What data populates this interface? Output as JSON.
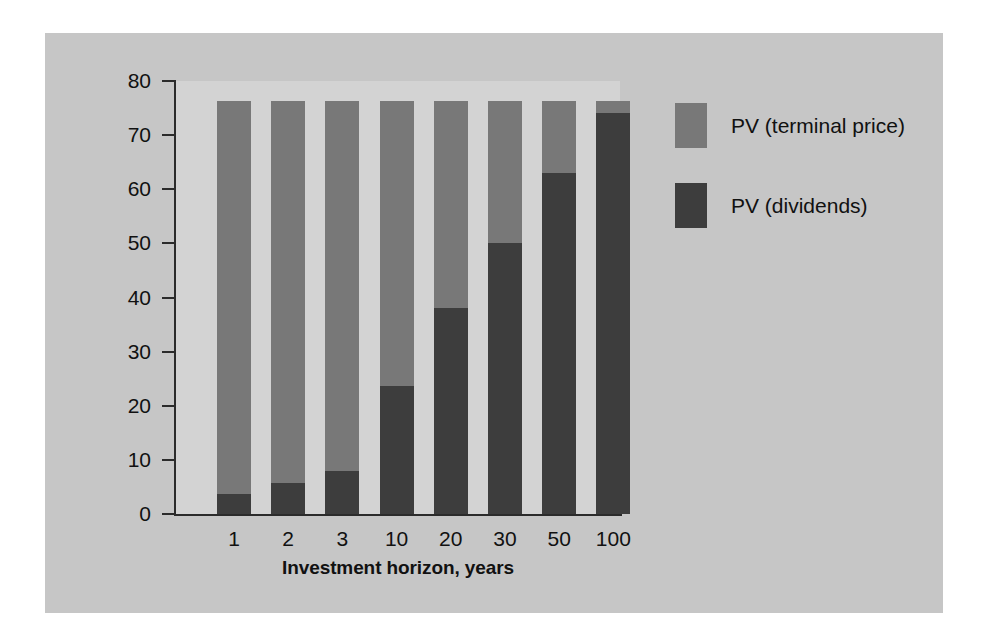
{
  "chart_data": {
    "type": "bar",
    "subtype": "stacked-bar",
    "title": "",
    "xlabel": "Investment horizon, years",
    "ylabel": "Value per share, dollars",
    "categories": [
      "1",
      "2",
      "3",
      "10",
      "20",
      "30",
      "50",
      "100"
    ],
    "ylim": [
      0,
      80
    ],
    "yticks": [
      0,
      10,
      20,
      30,
      40,
      50,
      60,
      70,
      80
    ],
    "grid": false,
    "legend_position": "right",
    "series": [
      {
        "name": "PV (dividends)",
        "color": "#3d3d3d",
        "values": [
          3.7,
          5.8,
          8.0,
          23.7,
          38.0,
          50.0,
          63.0,
          74.0
        ]
      },
      {
        "name": "PV (terminal price)",
        "color": "#787878",
        "values": [
          72.6,
          70.5,
          68.3,
          52.6,
          38.3,
          26.3,
          13.3,
          2.3
        ]
      }
    ],
    "totals": [
      76.3,
      76.3,
      76.3,
      76.3,
      76.3,
      76.3,
      76.3,
      76.3
    ]
  },
  "axes": {
    "y_tick_labels": [
      "80",
      "70",
      "60",
      "50",
      "40",
      "30",
      "20",
      "10",
      "0"
    ],
    "y_title": "Value per share, dollars",
    "x_tick_labels": [
      "1",
      "2",
      "3",
      "10",
      "20",
      "30",
      "50",
      "100"
    ],
    "x_title": "Investment horizon, years"
  },
  "legend": {
    "items": [
      {
        "label": "PV (terminal price)",
        "color": "#787878"
      },
      {
        "label": "PV (dividends)",
        "color": "#3d3d3d"
      }
    ]
  },
  "colors": {
    "page_background": "#ffffff",
    "panel_background": "#c6c6c6",
    "plot_background": "#d3d3d3",
    "axis": "#2b2b2b",
    "text": "#111111",
    "terminal_price": "#787878",
    "dividends": "#3d3d3d"
  }
}
